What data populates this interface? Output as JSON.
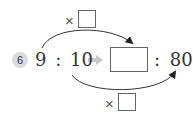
{
  "problem": {
    "number": "6",
    "left_ratio": {
      "a": "9",
      "sep": ":",
      "b": "10"
    },
    "right_ratio": {
      "a_blank": "",
      "sep": ":",
      "b": "80"
    },
    "top_operator": {
      "symbol": "×",
      "blank": ""
    },
    "bottom_operator": {
      "symbol": "×",
      "blank": ""
    }
  },
  "colors": {
    "text": "#333333",
    "badge": "#dcdcdc",
    "arrow_fill": "#c8c8c8",
    "curve": "#333333"
  }
}
